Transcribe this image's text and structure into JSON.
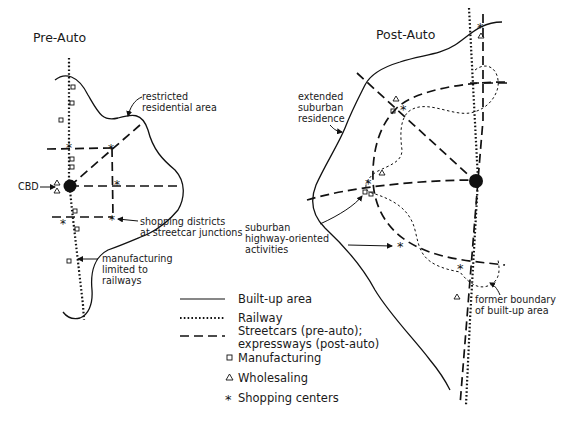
{
  "pre_auto": {
    "title": "Pre-Auto",
    "labels": {
      "restricted": [
        "restricted",
        "residential area"
      ],
      "cbd": "CBD",
      "shopping": [
        "shopping districts",
        "at streetcar junctions"
      ],
      "manufacturing": [
        "manufacturing",
        "limited to",
        "railways"
      ]
    }
  },
  "post_auto": {
    "title": "Post-Auto",
    "labels": {
      "extended": [
        "extended",
        "suburban",
        "residence"
      ],
      "suburban": [
        "suburban",
        "highway-oriented",
        "activities"
      ],
      "former": [
        "former boundary",
        "of built-up area"
      ]
    }
  },
  "legend": {
    "items": [
      {
        "symbol": "solid-line",
        "label": "Built-up area"
      },
      {
        "symbol": "dotted-line",
        "label": "Railway"
      },
      {
        "symbol": "dashed-line",
        "label": "Streetcars (pre-auto);",
        "label2": "expressways (post-auto)"
      },
      {
        "symbol": "square",
        "label": "Manufacturing"
      },
      {
        "symbol": "triangle",
        "label": "Wholesaling"
      },
      {
        "symbol": "asterisk",
        "label": "Shopping centers"
      }
    ]
  },
  "colors": {
    "ink": "#111111",
    "background": "#ffffff"
  }
}
